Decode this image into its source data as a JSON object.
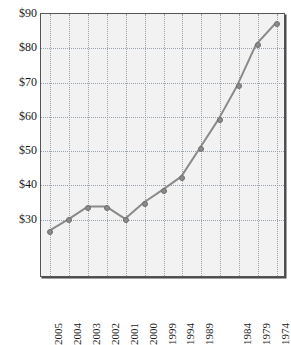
{
  "chart_data": {
    "type": "line",
    "title": "",
    "title_remnant": "",
    "xlabel": "",
    "ylabel": "",
    "categories": [
      "2005",
      "2004",
      "2003",
      "2002",
      "2001",
      "2000",
      "1999",
      "1994",
      "1989",
      "",
      "1984",
      "1979",
      "1974"
    ],
    "values": [
      26.5,
      29.8,
      33.4,
      33.4,
      29.8,
      34.6,
      38.3,
      42.2,
      50.6,
      59.1,
      69.0,
      81.0,
      87.0
    ],
    "series": [
      {
        "name": "price",
        "values": [
          26.5,
          29.8,
          33.4,
          33.4,
          29.8,
          34.6,
          38.3,
          42.2,
          50.6,
          59.1,
          69.0,
          81.0,
          87.0
        ]
      }
    ],
    "points": [
      {
        "x": "2005",
        "y": 26.5
      },
      {
        "x": "2004",
        "y": 29.8
      },
      {
        "x": "2003",
        "y": 33.4
      },
      {
        "x": "2002",
        "y": 33.4
      },
      {
        "x": "2001",
        "y": 29.8
      },
      {
        "x": "2000",
        "y": 34.6
      },
      {
        "x": "1999",
        "y": 38.3
      },
      {
        "x": "1994",
        "y": 42.2
      },
      {
        "x": "1989",
        "y": 50.6
      },
      {
        "x": "",
        "y": 59.1
      },
      {
        "x": "1984",
        "y": 69.0
      },
      {
        "x": "1979",
        "y": 81.0
      },
      {
        "x": "1974",
        "y": 87.0
      }
    ],
    "ylim": [
      13.0,
      90.0
    ],
    "yticks": [
      30,
      40,
      50,
      60,
      70,
      80,
      90
    ],
    "ytick_labels": [
      "$30",
      "$40",
      "$50",
      "$60",
      "$70",
      "$80",
      "$90"
    ],
    "xtick_labels": [
      "2005",
      "2004",
      "2003",
      "2002",
      "2001",
      "2000",
      "1999",
      "1994",
      "1989",
      "1984",
      "1979",
      "1974"
    ],
    "grid": true,
    "grid_style": "dotted",
    "legend": false,
    "legend_position": "none",
    "value_prefix": "$",
    "colors": {
      "line": "#8a8a8a",
      "marker": "#8a8a8a",
      "marker_edge": "#6f6f6f",
      "grid": "#9aa3ad",
      "plot_background": "#f2f2f2",
      "frame": "#555555",
      "text": "#1b1b1b",
      "page_background": "#ffffff"
    }
  }
}
